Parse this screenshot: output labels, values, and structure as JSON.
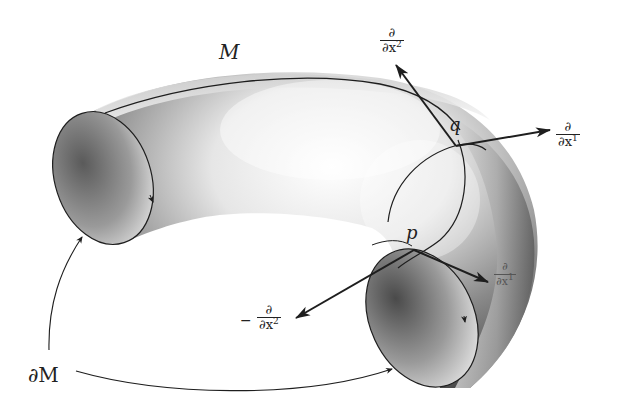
{
  "figure": {
    "labels": {
      "manifold": "M",
      "boundary": "∂M",
      "point_q": "q",
      "point_p": "p"
    },
    "vectors": {
      "q_d_dx2": {
        "numerator": "∂",
        "denominator_base": "∂x",
        "denominator_sup": "2",
        "sign": ""
      },
      "q_d_dx1": {
        "numerator": "∂",
        "denominator_base": "∂x",
        "denominator_sup": "1",
        "sign": ""
      },
      "p_d_dx1": {
        "numerator": "∂",
        "denominator_base": "∂x",
        "denominator_sup": "1",
        "sign": ""
      },
      "p_neg_d_dx2": {
        "numerator": "∂",
        "denominator_base": "∂x",
        "denominator_sup": "2",
        "sign": "−"
      }
    },
    "colors": {
      "line": "#1e1e1e",
      "surface_light": "#f4f4f4",
      "surface_dark": "#4a4a4a"
    }
  }
}
